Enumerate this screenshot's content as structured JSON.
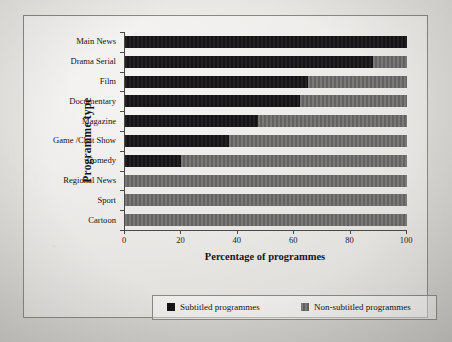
{
  "chart_data": {
    "type": "bar",
    "orientation": "horizontal",
    "stacked": true,
    "title": "",
    "xlabel": "Percentage of programmes",
    "ylabel": "Programme type",
    "xlim": [
      0,
      100
    ],
    "xticks": [
      "0",
      "20",
      "40",
      "60",
      "80",
      "100"
    ],
    "xtick_values": [
      0,
      20,
      40,
      60,
      80,
      100
    ],
    "grid": false,
    "legend_position": "bottom",
    "categories": [
      "Main News",
      "Drama Serial",
      "Film",
      "Documentary",
      "Magazine",
      "Game /Chat Show",
      "Comedy",
      "Regional News",
      "Sport",
      "Cartoon"
    ],
    "series": [
      {
        "name": "Subtitled programmes",
        "color": "#161416",
        "values": [
          100,
          88,
          65,
          62,
          47,
          37,
          20,
          0,
          0,
          0
        ]
      },
      {
        "name": "Non-subtitled programmes",
        "color": "#6c6a68",
        "values": [
          0,
          12,
          35,
          38,
          53,
          63,
          80,
          100,
          100,
          100
        ]
      }
    ]
  },
  "legend": {
    "items": [
      {
        "label": "Subtitled programmes",
        "swatch": "sub"
      },
      {
        "label": "Non-subtitled programmes",
        "swatch": "nonsub"
      }
    ]
  }
}
